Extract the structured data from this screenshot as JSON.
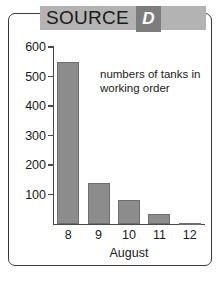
{
  "header": {
    "title": "SOURCE",
    "badge_label": "D",
    "band_color": "#b3b3b3",
    "badge_color": "#7d7d7d"
  },
  "chart_data": {
    "type": "bar",
    "title": "",
    "annotation": "numbers of tanks in working order",
    "categories": [
      "8",
      "9",
      "10",
      "11",
      "12"
    ],
    "values": [
      550,
      140,
      80,
      35,
      5
    ],
    "xlabel": "August",
    "ylabel": "",
    "ylim": [
      0,
      600
    ],
    "yticks": [
      100,
      200,
      300,
      400,
      500,
      600
    ],
    "ytick_labels": [
      "100",
      "200",
      "300",
      "400",
      "500",
      "600"
    ],
    "grid": false,
    "legend": "none",
    "bar_color": "#8c8c8c",
    "axis_color": "#4a4a4a"
  }
}
